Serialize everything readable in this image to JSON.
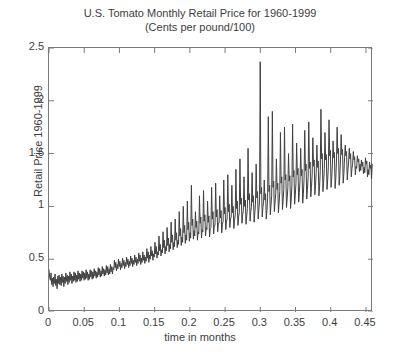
{
  "chart_data": {
    "type": "line",
    "title": "U.S. Tomato Monthly Retail Price for 1960-1999",
    "subtitle": "(Cents per pound/100)",
    "xlabel": "time in months",
    "ylabel": "Retail Price 1960-1999",
    "xlim": [
      0,
      0.46
    ],
    "ylim": [
      0,
      2.5
    ],
    "xticks": [
      0,
      0.05,
      0.1,
      0.15,
      0.2,
      0.25,
      0.3,
      0.35,
      0.4,
      0.45
    ],
    "xtick_labels": [
      "0",
      "0.05",
      "0.1",
      "0.15",
      "0.2",
      "0.25",
      "0.3",
      "0.35",
      "0.4",
      "0.45"
    ],
    "yticks": [
      0,
      0.5,
      1,
      1.5,
      2,
      2.5
    ],
    "ytick_labels": [
      "0",
      "0.5",
      "1",
      "1.5",
      "2",
      "2.5"
    ],
    "grid": false,
    "legend": null,
    "line_color": "#404040",
    "line_width": 1,
    "x_step": 0.000958,
    "series": [
      {
        "name": "U.S. Tomato Monthly Retail Price",
        "values": [
          0.4,
          0.33,
          0.3,
          0.37,
          0.26,
          0.32,
          0.24,
          0.33,
          0.27,
          0.36,
          0.25,
          0.31,
          0.22,
          0.34,
          0.27,
          0.35,
          0.26,
          0.33,
          0.25,
          0.36,
          0.28,
          0.34,
          0.24,
          0.33,
          0.27,
          0.37,
          0.29,
          0.35,
          0.26,
          0.34,
          0.28,
          0.38,
          0.3,
          0.36,
          0.27,
          0.34,
          0.29,
          0.38,
          0.3,
          0.37,
          0.28,
          0.35,
          0.29,
          0.39,
          0.31,
          0.37,
          0.29,
          0.36,
          0.3,
          0.39,
          0.32,
          0.38,
          0.3,
          0.37,
          0.31,
          0.4,
          0.32,
          0.38,
          0.3,
          0.36,
          0.31,
          0.4,
          0.33,
          0.39,
          0.31,
          0.38,
          0.32,
          0.41,
          0.34,
          0.39,
          0.32,
          0.38,
          0.33,
          0.42,
          0.35,
          0.41,
          0.33,
          0.39,
          0.34,
          0.43,
          0.36,
          0.41,
          0.34,
          0.4,
          0.35,
          0.44,
          0.37,
          0.43,
          0.35,
          0.41,
          0.36,
          0.45,
          0.38,
          0.43,
          0.36,
          0.42,
          0.4,
          0.49,
          0.42,
          0.47,
          0.39,
          0.45,
          0.41,
          0.5,
          0.43,
          0.48,
          0.4,
          0.46,
          0.42,
          0.51,
          0.44,
          0.49,
          0.41,
          0.47,
          0.43,
          0.52,
          0.45,
          0.5,
          0.42,
          0.48,
          0.44,
          0.53,
          0.46,
          0.51,
          0.43,
          0.49,
          0.45,
          0.54,
          0.47,
          0.52,
          0.44,
          0.5,
          0.46,
          0.56,
          0.48,
          0.54,
          0.45,
          0.51,
          0.47,
          0.57,
          0.49,
          0.54,
          0.46,
          0.52,
          0.48,
          0.6,
          0.51,
          0.57,
          0.47,
          0.54,
          0.5,
          0.62,
          0.53,
          0.58,
          0.49,
          0.55,
          0.52,
          0.66,
          0.55,
          0.62,
          0.51,
          0.57,
          0.54,
          0.72,
          0.58,
          0.64,
          0.53,
          0.59,
          0.56,
          0.76,
          0.61,
          0.68,
          0.55,
          0.62,
          0.58,
          0.8,
          0.63,
          0.7,
          0.57,
          0.64,
          0.6,
          0.85,
          0.66,
          0.73,
          0.59,
          0.66,
          0.62,
          0.88,
          0.68,
          0.75,
          0.61,
          0.68,
          0.64,
          0.95,
          0.72,
          0.79,
          0.63,
          0.71,
          0.66,
          1.0,
          0.75,
          0.82,
          0.65,
          0.73,
          0.68,
          1.05,
          0.78,
          0.85,
          0.67,
          0.75,
          0.7,
          1.2,
          0.82,
          0.88,
          0.69,
          0.77,
          0.72,
          0.95,
          0.8,
          0.86,
          0.68,
          0.76,
          0.74,
          1.1,
          0.84,
          0.9,
          0.7,
          0.78,
          0.76,
          1.15,
          0.86,
          0.92,
          0.72,
          0.8,
          0.78,
          1.05,
          0.85,
          0.91,
          0.71,
          0.79,
          0.8,
          1.18,
          0.88,
          0.95,
          0.74,
          0.82,
          0.82,
          1.22,
          0.9,
          0.97,
          0.76,
          0.84,
          0.84,
          1.1,
          0.89,
          0.96,
          0.75,
          0.83,
          0.86,
          1.25,
          0.93,
          0.99,
          0.78,
          0.86,
          0.88,
          1.3,
          0.95,
          1.02,
          0.8,
          0.88,
          0.9,
          1.2,
          0.94,
          1.0,
          0.79,
          0.87,
          0.92,
          1.35,
          0.98,
          1.05,
          0.82,
          0.9,
          0.94,
          1.45,
          1.02,
          1.08,
          0.84,
          0.92,
          0.96,
          1.28,
          1.0,
          1.06,
          0.83,
          0.91,
          0.98,
          1.55,
          1.06,
          1.12,
          0.86,
          0.95,
          1.0,
          1.32,
          1.04,
          1.1,
          0.85,
          0.94,
          1.02,
          1.4,
          1.08,
          1.14,
          0.88,
          0.97,
          1.05,
          2.37,
          1.12,
          1.18,
          0.9,
          0.99,
          1.04,
          1.25,
          1.06,
          1.12,
          0.88,
          0.96,
          1.08,
          1.85,
          1.14,
          1.2,
          0.92,
          1.01,
          1.1,
          1.9,
          1.18,
          1.24,
          0.95,
          1.04,
          1.12,
          1.45,
          1.16,
          1.22,
          0.94,
          1.03,
          1.14,
          1.7,
          1.22,
          1.28,
          0.97,
          1.06,
          1.16,
          1.75,
          1.25,
          1.3,
          0.99,
          1.08,
          1.18,
          1.5,
          1.24,
          1.29,
          0.98,
          1.07,
          1.2,
          1.78,
          1.28,
          1.34,
          1.02,
          1.11,
          1.22,
          1.6,
          1.3,
          1.36,
          1.04,
          1.13,
          1.24,
          1.55,
          1.29,
          1.35,
          1.03,
          1.12,
          1.26,
          1.72,
          1.34,
          1.4,
          1.07,
          1.16,
          1.28,
          1.8,
          1.36,
          1.42,
          1.09,
          1.18,
          1.3,
          1.65,
          1.38,
          1.44,
          1.11,
          1.2,
          1.32,
          1.58,
          1.37,
          1.43,
          1.1,
          1.19,
          1.34,
          1.92,
          1.45,
          1.5,
          1.14,
          1.23,
          1.36,
          1.7,
          1.44,
          1.49,
          1.16,
          1.25,
          1.38,
          1.82,
          1.48,
          1.53,
          1.18,
          1.27,
          1.4,
          1.62,
          1.46,
          1.51,
          1.17,
          1.26,
          1.42,
          1.75,
          1.5,
          1.55,
          1.2,
          1.29,
          1.44,
          1.68,
          1.49,
          1.54,
          1.22,
          1.31,
          1.46,
          1.58,
          1.48,
          1.52,
          1.25,
          1.34,
          1.42,
          1.55,
          1.45,
          1.5,
          1.28,
          1.36,
          1.4,
          1.52,
          1.44,
          1.47,
          1.3,
          1.38,
          1.36,
          1.48,
          1.42,
          1.45,
          1.33,
          1.4,
          1.34,
          1.44,
          1.38,
          1.42,
          1.31,
          1.37,
          1.32,
          1.46,
          1.4,
          1.43,
          1.28,
          1.35,
          1.3,
          1.42,
          1.36,
          1.39,
          1.26,
          1.4
        ]
      }
    ]
  }
}
